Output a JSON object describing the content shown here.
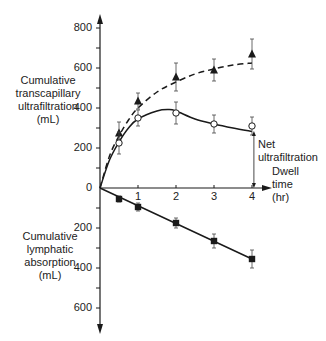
{
  "chart_data": {
    "type": "line",
    "title": "",
    "xlabel": "Dwell time (hr)",
    "xlabel_lines": [
      "Dwell",
      "time",
      "(hr)"
    ],
    "ylabel_upper": "Cumulative transcapillary ultrafiltration (mL)",
    "ylabel_upper_lines": [
      "Cumulative",
      "transcapillary",
      "ultrafiltration",
      "(mL)"
    ],
    "ylabel_lower": "Cumulative lymphatic absorption (mL)",
    "ylabel_lower_lines": [
      "Cumulative",
      "lymphatic",
      "absorption",
      "(mL)"
    ],
    "x_ticks": [
      1,
      2,
      3,
      4
    ],
    "y_ticks_upper": [
      200,
      400,
      600,
      800
    ],
    "y_ticks_lower": [
      200,
      400,
      600
    ],
    "xlim": [
      0,
      4.5
    ],
    "ylim_upper": [
      0,
      850
    ],
    "ylim_lower": [
      0,
      650
    ],
    "grid": false,
    "annotation": {
      "text_lines": [
        "Net",
        "ultrafiltration"
      ],
      "x": 4.05,
      "from": 285,
      "to": 0
    },
    "series": [
      {
        "name": "Cumulative transcapillary ultrafiltration",
        "marker": "filled-triangle",
        "line": "dashed",
        "direction": "up",
        "x": [
          0,
          0.5,
          1,
          2,
          3,
          4
        ],
        "values": [
          0,
          275,
          435,
          555,
          590,
          670
        ],
        "errors": [
          0,
          55,
          40,
          70,
          55,
          75
        ],
        "fit": [
          [
            0,
            0
          ],
          [
            0.25,
            160
          ],
          [
            0.5,
            260
          ],
          [
            0.75,
            340
          ],
          [
            1,
            400
          ],
          [
            1.5,
            480
          ],
          [
            2,
            530
          ],
          [
            2.5,
            570
          ],
          [
            3,
            595
          ],
          [
            3.5,
            615
          ],
          [
            4,
            625
          ]
        ]
      },
      {
        "name": "Net ultrafiltration",
        "marker": "open-circle",
        "line": "solid",
        "direction": "up",
        "x": [
          0,
          0.5,
          1,
          2,
          3,
          4
        ],
        "values": [
          0,
          225,
          350,
          375,
          320,
          310
        ],
        "errors": [
          0,
          55,
          40,
          55,
          45,
          45
        ],
        "fit": [
          [
            0,
            0
          ],
          [
            0.25,
            140
          ],
          [
            0.5,
            230
          ],
          [
            0.75,
            300
          ],
          [
            1,
            345
          ],
          [
            1.5,
            385
          ],
          [
            1.8,
            392
          ],
          [
            2,
            385
          ],
          [
            2.5,
            345
          ],
          [
            3,
            320
          ],
          [
            3.5,
            300
          ],
          [
            4,
            283
          ]
        ]
      },
      {
        "name": "Cumulative lymphatic absorption",
        "marker": "filled-square",
        "line": "solid",
        "direction": "down",
        "x": [
          0,
          0.5,
          1,
          2,
          3,
          4
        ],
        "values": [
          0,
          55,
          95,
          175,
          265,
          355
        ],
        "errors": [
          0,
          15,
          20,
          25,
          35,
          45
        ],
        "fit": [
          [
            0,
            0
          ],
          [
            4,
            355
          ]
        ]
      }
    ]
  }
}
